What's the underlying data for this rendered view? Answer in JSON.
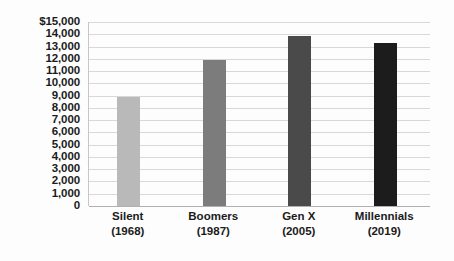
{
  "chart_data": {
    "type": "bar",
    "title": "",
    "subtitle": "",
    "xlabel": "",
    "ylabel": "",
    "categories": [
      "Silent",
      "Boomers",
      "Gen X",
      "Millennials"
    ],
    "category_sublabels": [
      "(1968)",
      "(1987)",
      "(2005)",
      "(2019)"
    ],
    "values": [
      8900,
      11900,
      13900,
      13250
    ],
    "ylim": [
      0,
      15000
    ],
    "ytick_step": 1000,
    "ytick_labels": [
      "$15,000",
      "14,000",
      "13,000",
      "12,000",
      "11,000",
      "10,000",
      "9,000",
      "8,000",
      "7,000",
      "6,000",
      "5,000",
      "4,000",
      "3,000",
      "2,000",
      "1,000",
      "0"
    ],
    "ytick_values": [
      15000,
      14000,
      13000,
      12000,
      11000,
      10000,
      9000,
      8000,
      7000,
      6000,
      5000,
      4000,
      3000,
      2000,
      1000,
      0
    ],
    "series": [
      {
        "name": "",
        "values": [
          8900,
          11900,
          13900,
          13250
        ],
        "colors": [
          "#b9b9b9",
          "#7c7c7c",
          "#4a4a4a",
          "#1c1c1c"
        ]
      }
    ],
    "bar_colors": [
      "#b9b9b9",
      "#7c7c7c",
      "#4a4a4a",
      "#1c1c1c"
    ],
    "grid": true,
    "grid_color": "#d8d8d8",
    "legend": false,
    "legend_position": "none",
    "annotations": [],
    "background_color": "#fdfdfd",
    "text_color": "#1b1b1b"
  }
}
